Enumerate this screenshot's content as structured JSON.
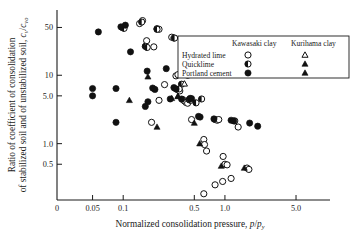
{
  "chart_data": {
    "type": "scatter",
    "title": "",
    "xlabel": "Normalized consolidation pressure, p/p_y",
    "xlabel_main": "Normalized consolidation pressure, ",
    "xlabel_sym_num": "p",
    "xlabel_sym_slash": "/",
    "xlabel_sym_den": "p",
    "xlabel_sym_sub": "y",
    "ylabel_line1": "Ratio of coefficient of consolidation",
    "ylabel_line2_main": "of stabilized soil and of unstabilized soil, ",
    "ylabel_line2_sym1": "c",
    "ylabel_line2_sub1": "v",
    "ylabel_line2_slash": "/",
    "ylabel_line2_sym2": "c",
    "ylabel_line2_sub2": "vo",
    "xscale": "log",
    "yscale": "log",
    "xlim": [
      0.03,
      9.0
    ],
    "ylim": [
      0.15,
      90.0
    ],
    "grid": false,
    "legend_position": "upper-right-inside",
    "xticks": [
      {
        "value": 0.05,
        "label": "0.05"
      },
      {
        "value": 0.1,
        "label": "0.1"
      },
      {
        "value": 0.5,
        "label": "0.5"
      },
      {
        "value": 1.0,
        "label": "1.0"
      },
      {
        "value": 5.0,
        "label": "5.0"
      }
    ],
    "xtick_origin_label": "0",
    "yticks": [
      {
        "value": 50,
        "label": "50"
      },
      {
        "value": 10,
        "label": "10"
      },
      {
        "value": 5.0,
        "label": "5.0"
      },
      {
        "value": 1.0,
        "label": "1.0"
      },
      {
        "value": 0.5,
        "label": "0.5"
      }
    ],
    "legend": {
      "col_header_1": "Kawasaki clay",
      "col_header_2": "Kurihama clay",
      "rows": [
        {
          "label": "Hydrated lime",
          "marker_1": "open-circle",
          "marker_2": "open-triangle"
        },
        {
          "label": "Quicklime",
          "marker_1": "half-circle",
          "marker_2": "filled-triangle"
        },
        {
          "label": "Portland cement",
          "marker_1": "filled-circle",
          "marker_2": "filled-triangle"
        }
      ]
    },
    "series": [
      {
        "name": "Hydrated lime (Kawasaki clay)",
        "marker": "open-circle",
        "points": [
          [
            0.145,
            57.0
          ],
          [
            0.155,
            63.0
          ],
          [
            0.17,
            32.0
          ],
          [
            0.215,
            48.0
          ],
          [
            0.225,
            47.0
          ],
          [
            0.3,
            36.0
          ],
          [
            0.315,
            35.0
          ],
          [
            0.2,
            26.0
          ],
          [
            0.4,
            21.0
          ],
          [
            0.405,
            19.0
          ],
          [
            0.33,
            9.8
          ],
          [
            0.345,
            10.2
          ],
          [
            0.43,
            10.0
          ],
          [
            0.255,
            7.3
          ],
          [
            0.345,
            6.1
          ],
          [
            0.36,
            5.9
          ],
          [
            0.225,
            4.3
          ],
          [
            0.385,
            4.4
          ],
          [
            0.4,
            4.2
          ],
          [
            0.415,
            4.0
          ],
          [
            0.43,
            3.9
          ],
          [
            0.19,
            2.05
          ],
          [
            0.47,
            2.25
          ],
          [
            0.8,
            2.25
          ],
          [
            0.84,
            2.2
          ],
          [
            0.87,
            2.25
          ],
          [
            1.25,
            2.15
          ],
          [
            1.35,
            1.75
          ],
          [
            0.62,
            1.15
          ],
          [
            0.63,
            0.97
          ],
          [
            0.66,
            0.78
          ],
          [
            0.96,
            0.65
          ],
          [
            1.0,
            0.5
          ],
          [
            1.05,
            0.49
          ],
          [
            1.65,
            0.44
          ],
          [
            1.72,
            0.42
          ],
          [
            0.8,
            0.25
          ],
          [
            0.95,
            0.28
          ],
          [
            1.15,
            0.31
          ],
          [
            0.62,
            0.185
          ]
        ]
      },
      {
        "name": "Quicklime (Kawasaki clay)",
        "marker": "half-circle",
        "points": [
          [
            0.152,
            60.0
          ],
          [
            0.098,
            50.0
          ],
          [
            0.102,
            48.5
          ],
          [
            0.215,
            47.0
          ],
          [
            0.165,
            26.5
          ],
          [
            0.172,
            25.5
          ],
          [
            0.32,
            35.0
          ],
          [
            0.375,
            7.4
          ],
          [
            0.355,
            6.3
          ],
          [
            0.445,
            4.4
          ],
          [
            0.46,
            4.3
          ],
          [
            0.52,
            3.95
          ],
          [
            0.59,
            4.5
          ]
        ]
      },
      {
        "name": "Portland cement (Kawasaki clay)",
        "marker": "filled-circle",
        "points": [
          [
            0.057,
            43.0
          ],
          [
            0.095,
            51.0
          ],
          [
            0.105,
            54.0
          ],
          [
            0.118,
            22.0
          ],
          [
            0.172,
            11.5
          ],
          [
            0.265,
            12.5
          ],
          [
            0.05,
            6.4
          ],
          [
            0.05,
            5.0
          ],
          [
            0.085,
            6.4
          ],
          [
            0.195,
            6.5
          ],
          [
            0.205,
            6.2
          ],
          [
            0.315,
            6.6
          ],
          [
            0.33,
            6.3
          ],
          [
            0.175,
            4.1
          ],
          [
            0.29,
            4.5
          ],
          [
            0.375,
            4.5
          ],
          [
            0.455,
            4.6
          ],
          [
            0.47,
            4.55
          ],
          [
            0.085,
            2.05
          ],
          [
            0.165,
            3.5
          ],
          [
            0.55,
            2.5
          ],
          [
            0.57,
            2.45
          ],
          [
            0.78,
            2.3
          ],
          [
            1.15,
            2.2
          ],
          [
            1.22,
            2.15
          ],
          [
            1.75,
            2.0
          ],
          [
            2.1,
            1.8
          ]
        ]
      },
      {
        "name": "Hydrated lime (Kurihama clay)",
        "marker": "open-triangle",
        "points": [
          [
            0.4,
            7.5
          ]
        ]
      },
      {
        "name": "Quicklime / Portland cement (Kurihama clay)",
        "marker": "filled-triangle",
        "points": [
          [
            0.115,
            4.3
          ],
          [
            0.175,
            9.5
          ],
          [
            0.215,
            1.75
          ],
          [
            0.3,
            4.6
          ],
          [
            0.345,
            4.9
          ],
          [
            0.325,
            6.5
          ],
          [
            0.5,
            2.0
          ],
          [
            0.565,
            1.0
          ],
          [
            0.92,
            0.47
          ],
          [
            1.55,
            0.44
          ],
          [
            0.345,
            4.95
          ]
        ]
      }
    ]
  }
}
